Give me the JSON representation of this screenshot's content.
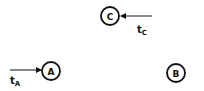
{
  "diagram": {
    "nodes": [
      {
        "id": "C",
        "label": "C",
        "cx": 110,
        "cy": 16,
        "r": 9
      },
      {
        "id": "A",
        "label": "A",
        "cx": 51,
        "cy": 71,
        "r": 9
      },
      {
        "id": "B",
        "label": "B",
        "cx": 176,
        "cy": 73,
        "r": 9
      }
    ],
    "inputs": [
      {
        "target": "C",
        "label_main": "t",
        "label_sub": "C",
        "from": [
          152,
          16
        ],
        "to": [
          120,
          16
        ],
        "label_pos": [
          137,
          32
        ]
      },
      {
        "target": "A",
        "label_main": "t",
        "label_sub": "A",
        "from": [
          10,
          70
        ],
        "to": [
          41,
          70
        ],
        "label_pos": [
          11,
          83
        ]
      }
    ],
    "colors": {
      "stroke": "#111111",
      "background": "#ffffff"
    }
  }
}
